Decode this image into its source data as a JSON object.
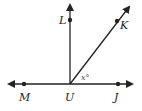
{
  "diagram": {
    "vertex": "U",
    "points": {
      "L": "L",
      "K": "K",
      "M": "M",
      "U": "U",
      "J": "J"
    },
    "angle_label": "x°",
    "rays": [
      "UL",
      "UK",
      "UM",
      "UJ"
    ],
    "stroke_color": "#222222"
  }
}
